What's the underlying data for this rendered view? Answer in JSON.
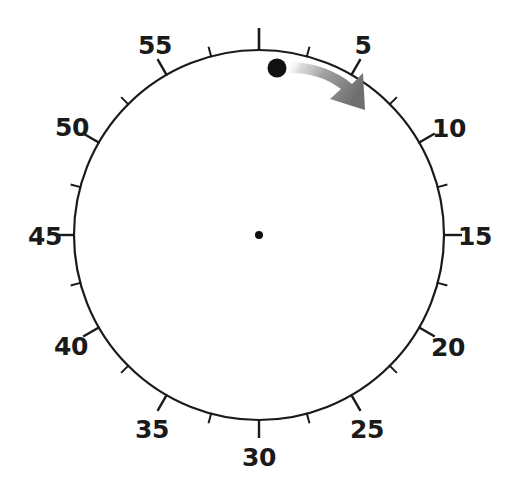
{
  "figure": {
    "kind": "analog-clock-dial",
    "title": "",
    "background_color": "#ffffff",
    "stroke_color": "#1a1a1a",
    "width": 508,
    "height": 486
  },
  "dial": {
    "center_x": 259,
    "center_y": 235,
    "radius": 185,
    "ring_stroke_width": 2.2,
    "center_dot_radius": 4,
    "minor_tick_length": 10,
    "major_tick_length": 18,
    "top_tick_length": 22,
    "label_radius": 214
  },
  "chart_data": {
    "type": "scatter",
    "title": "",
    "xlabel": "",
    "ylabel": "",
    "units": "minutes",
    "scale_min": 0,
    "scale_max": 60,
    "major_tick_interval": 5,
    "minor_tick_interval": 2.5,
    "grid": false,
    "legend": "none",
    "tick_labels": [
      "5",
      "10",
      "15",
      "20",
      "25",
      "30",
      "35",
      "40",
      "45",
      "50",
      "55"
    ],
    "tick_values": [
      5,
      10,
      15,
      20,
      25,
      30,
      35,
      40,
      45,
      50,
      55
    ],
    "unlabeled_major_tick_value": 60,
    "minor_tick_values": [
      2.5,
      7.5,
      12.5,
      17.5,
      22.5,
      27.5,
      32.5,
      37.5,
      42.5,
      47.5,
      52.5,
      57.5
    ],
    "marker": {
      "label": "",
      "value": 2,
      "x": 277,
      "y": 68,
      "radius": 9.5,
      "color": "#111111"
    },
    "annotation_arrow": {
      "direction": "clockwise",
      "from_value": 2,
      "to_value": 5.5,
      "color_start": "#f2f2f2",
      "color_mid": "#9b9b9b",
      "color_end": "#6e6e6e"
    }
  },
  "labels": [
    {
      "text": "55",
      "x": 155,
      "y": 45
    },
    {
      "text": "5",
      "x": 363,
      "y": 45
    },
    {
      "text": "10",
      "x": 449,
      "y": 128
    },
    {
      "text": "15",
      "x": 475,
      "y": 236
    },
    {
      "text": "20",
      "x": 448,
      "y": 347
    },
    {
      "text": "25",
      "x": 367,
      "y": 429
    },
    {
      "text": "30",
      "x": 259,
      "y": 457
    },
    {
      "text": "35",
      "x": 152,
      "y": 429
    },
    {
      "text": "40",
      "x": 71,
      "y": 346
    },
    {
      "text": "45",
      "x": 45,
      "y": 236
    },
    {
      "text": "50",
      "x": 72,
      "y": 127
    }
  ]
}
